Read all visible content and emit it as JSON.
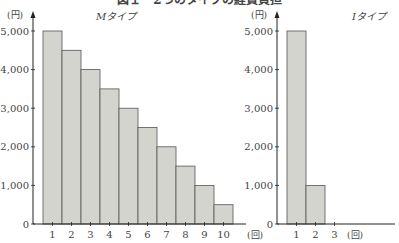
{
  "figure": {
    "title": "図１　2つのタイプの経費負担"
  },
  "chart_data": [
    {
      "type": "bar",
      "title": "Mタイプ",
      "xlabel": "(回)",
      "ylabel": "(円)",
      "categories": [
        "1",
        "2",
        "3",
        "4",
        "5",
        "6",
        "7",
        "8",
        "9",
        "10"
      ],
      "values": [
        5000,
        4500,
        4000,
        3500,
        3000,
        2500,
        2000,
        1500,
        1000,
        500
      ],
      "yticks": [
        "0",
        "1,000",
        "2,000",
        "3,000",
        "4,000",
        "5,000"
      ],
      "ylim": [
        0,
        5000
      ],
      "grid": false,
      "bar_color": "#d4d4cf"
    },
    {
      "type": "bar",
      "title": "Iタイプ",
      "xlabel": "(回)",
      "ylabel": "(円)",
      "categories": [
        "1",
        "2",
        "3"
      ],
      "values": [
        5000,
        1000,
        0
      ],
      "yticks": [
        "0",
        "1,000",
        "2,000",
        "3,000",
        "4,000",
        "5,000"
      ],
      "ylim": [
        0,
        5000
      ],
      "grid": false,
      "bar_color": "#d4d4cf"
    }
  ]
}
